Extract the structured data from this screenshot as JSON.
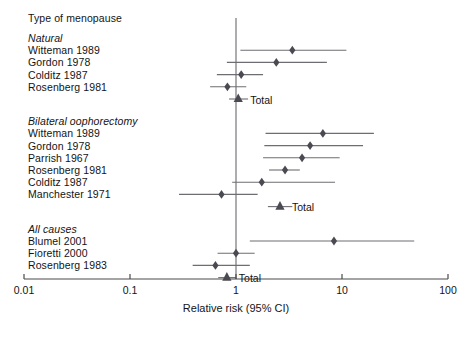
{
  "chart_data": {
    "type": "forest",
    "title": "Type of menopause",
    "xlabel": "Relative risk (95% CI)",
    "ylabel": "",
    "xscale": "log",
    "xlim": [
      0.01,
      100
    ],
    "ticks": [
      {
        "value": 0.01,
        "label": "0.01"
      },
      {
        "value": 0.1,
        "label": "0.1"
      },
      {
        "value": 1,
        "label": "1"
      },
      {
        "value": 10,
        "label": "10"
      },
      {
        "value": 100,
        "label": "100"
      }
    ],
    "reference_line": 1,
    "grid": false,
    "legend": "none",
    "groups": [
      {
        "name": "Natural",
        "studies": [
          {
            "label": "Witteman 1989",
            "rr": 3.4,
            "ci_low": 1.1,
            "ci_high": 11.0,
            "marker": "diamond"
          },
          {
            "label": "Gordon 1978",
            "rr": 2.4,
            "ci_low": 0.82,
            "ci_high": 7.2,
            "marker": "diamond"
          },
          {
            "label": "Colditz 1987",
            "rr": 1.12,
            "ci_low": 0.66,
            "ci_high": 1.8,
            "marker": "diamond"
          },
          {
            "label": "Rosenberg 1981",
            "rr": 0.83,
            "ci_low": 0.57,
            "ci_high": 1.25,
            "marker": "diamond"
          }
        ],
        "total": {
          "label": "Total",
          "rr": 1.05,
          "ci_low": 0.86,
          "ci_high": 1.3,
          "marker": "triangle"
        }
      },
      {
        "name": "Bilateral oophorectomy",
        "studies": [
          {
            "label": "Witteman 1989",
            "rr": 6.6,
            "ci_low": 1.9,
            "ci_high": 20.0,
            "marker": "diamond"
          },
          {
            "label": "Gordon 1978",
            "rr": 5.0,
            "ci_low": 1.85,
            "ci_high": 15.8,
            "marker": "diamond"
          },
          {
            "label": "Parrish 1967",
            "rr": 4.2,
            "ci_low": 1.8,
            "ci_high": 9.5,
            "marker": "diamond"
          },
          {
            "label": "Rosenberg 1981",
            "rr": 2.9,
            "ci_low": 2.05,
            "ci_high": 4.0,
            "marker": "diamond"
          },
          {
            "label": "Colditz 1987",
            "rr": 1.75,
            "ci_low": 0.92,
            "ci_high": 8.6,
            "marker": "diamond"
          },
          {
            "label": "Manchester 1971",
            "rr": 0.73,
            "ci_low": 0.29,
            "ci_high": 1.6,
            "marker": "diamond"
          }
        ],
        "total": {
          "label": "Total",
          "rr": 2.6,
          "ci_low": 2.0,
          "ci_high": 3.4,
          "marker": "triangle"
        }
      },
      {
        "name": "All causes",
        "studies": [
          {
            "label": "Blumel 2001",
            "rr": 8.4,
            "ci_low": 1.35,
            "ci_high": 48.0,
            "marker": "diamond"
          },
          {
            "label": "Fioretti 2000",
            "rr": 1.0,
            "ci_low": 0.67,
            "ci_high": 1.5,
            "marker": "diamond"
          },
          {
            "label": "Rosenberg 1983",
            "rr": 0.64,
            "ci_low": 0.39,
            "ci_high": 1.35,
            "marker": "diamond"
          }
        ],
        "total": {
          "label": "Total",
          "rr": 0.82,
          "ci_low": 0.68,
          "ci_high": 1.0,
          "marker": "triangle"
        }
      }
    ]
  },
  "colors": {
    "marker": "#4a4a52",
    "line": "#6e6e72",
    "axis": "#4a4a4a",
    "reference": "#8a8a8e",
    "text": "#141414"
  }
}
